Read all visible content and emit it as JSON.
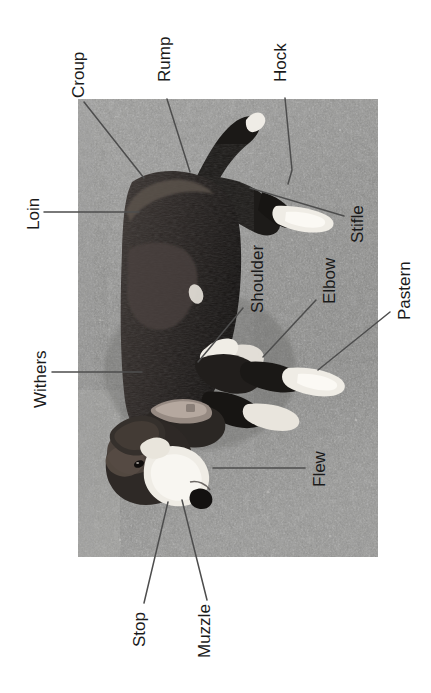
{
  "figure": {
    "caption": "",
    "orientation": "rotated-90-ccw",
    "photo": {
      "alt": "Black, white and tan dog standing in profile on gravel ground",
      "x": 78,
      "y": 99,
      "width": 300,
      "height": 458,
      "ground_color": "#8e8e8e",
      "dog_dark_color": "#221f1e",
      "dog_mid_color": "#4a4441",
      "dog_white_color": "#eeeae3"
    },
    "line_color": "#4d4d4d",
    "text_color": "#1a1a1a"
  },
  "labels": [
    {
      "id": "croup",
      "text": "Croup",
      "x": 70,
      "y": 98,
      "fontsize": 17
    },
    {
      "id": "rump",
      "text": "Rump",
      "x": 156,
      "y": 82,
      "fontsize": 17
    },
    {
      "id": "hock",
      "text": "Hock",
      "x": 272,
      "y": 82,
      "fontsize": 17
    },
    {
      "id": "loin",
      "text": "Loin",
      "x": 25,
      "y": 230,
      "fontsize": 17
    },
    {
      "id": "stifle",
      "text": "Stifle",
      "x": 349,
      "y": 243,
      "fontsize": 17
    },
    {
      "id": "shoulder",
      "text": "Shoulder",
      "x": 249,
      "y": 313,
      "fontsize": 17
    },
    {
      "id": "elbow",
      "text": "Elbow",
      "x": 321,
      "y": 304,
      "fontsize": 17
    },
    {
      "id": "pastern",
      "text": "Pastern",
      "x": 396,
      "y": 320,
      "fontsize": 17
    },
    {
      "id": "withers",
      "text": "Withers",
      "x": 32,
      "y": 408,
      "fontsize": 17
    },
    {
      "id": "flew",
      "text": "Flew",
      "x": 311,
      "y": 487,
      "fontsize": 17
    },
    {
      "id": "stop",
      "text": "Stop",
      "x": 131,
      "y": 647,
      "fontsize": 17
    },
    {
      "id": "muzzle",
      "text": "Muzzle",
      "x": 196,
      "y": 658,
      "fontsize": 17
    }
  ],
  "leader_lines": [
    {
      "id": "croup-leader",
      "points": "84,102 144,178"
    },
    {
      "id": "rump-leader",
      "points": "167,99 190,172"
    },
    {
      "id": "hock-leader",
      "points": "285,98 292,170 288,184"
    },
    {
      "id": "loin-leader",
      "points": "44,212 139,212"
    },
    {
      "id": "stifle-leader",
      "points": "344,216 250,188"
    },
    {
      "id": "shoulder-leader",
      "points": "243,308 198,362"
    },
    {
      "id": "elbow-leader",
      "points": "316,300 263,357"
    },
    {
      "id": "pastern-leader",
      "points": "390,312 318,370"
    },
    {
      "id": "withers-leader",
      "points": "52,372 142,372"
    },
    {
      "id": "flew-leader",
      "points": "305,468 213,468"
    },
    {
      "id": "stop-leader",
      "points": "144,603 168,502"
    },
    {
      "id": "muzzle-leader",
      "points": "207,600 182,500"
    }
  ]
}
